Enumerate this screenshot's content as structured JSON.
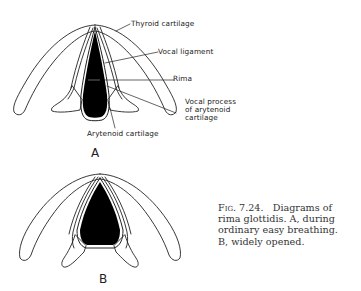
{
  "figure": {
    "diagram_a": {
      "label": "A",
      "annotations": {
        "thyroid": "Thyroid cartilage",
        "vocal_ligament": "Vocal ligament",
        "rima": "Rima",
        "vocal_process_1": "Vocal process",
        "vocal_process_2": "of arytenoid",
        "vocal_process_3": "cartilage",
        "arytenoid": "Arytenoid cartilage"
      }
    },
    "diagram_b": {
      "label": "B"
    },
    "caption": {
      "fig_number": "Fig. 7.24.",
      "text_1": "Diagrams of rima glottidis.",
      "marker_a": "A,",
      "text_2": "during ordinary easy breathing.",
      "marker_b": "B,",
      "text_3": "widely opened."
    },
    "colors": {
      "ink": "#1a1a1a",
      "fill": "#000000",
      "background": "#ffffff"
    }
  }
}
